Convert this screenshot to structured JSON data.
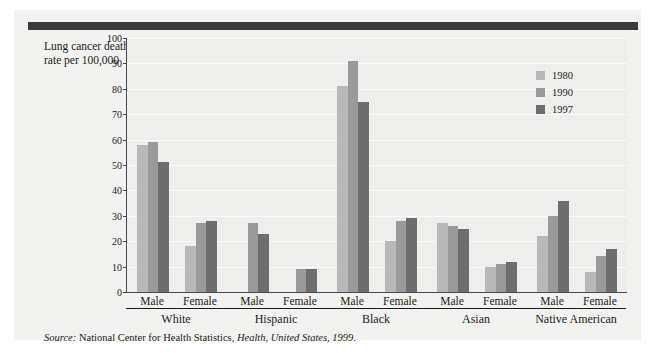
{
  "axis_title": "Lung cancer death rate per 100,000",
  "source": {
    "label": "Source:",
    "agency": " National Center for Health Statistics, ",
    "publication": "Health, United States, 1999",
    "end": "."
  },
  "legend": {
    "items": [
      {
        "label": "1980",
        "color": "#b8b8b8"
      },
      {
        "label": "1990",
        "color": "#9a9a9a"
      },
      {
        "label": "1997",
        "color": "#6e6e6e"
      }
    ]
  },
  "chart_data": {
    "type": "bar",
    "title": "",
    "xlabel": "",
    "ylabel": "Lung cancer death rate per 100,000",
    "ylim": [
      0,
      100
    ],
    "ytick_step": 10,
    "yticks": [
      0,
      10,
      20,
      30,
      40,
      50,
      60,
      70,
      80,
      90,
      100
    ],
    "grid": true,
    "legend_position": "top-right",
    "series": [
      {
        "name": "1980",
        "color": "#b8b8b8"
      },
      {
        "name": "1990",
        "color": "#9a9a9a"
      },
      {
        "name": "1997",
        "color": "#6e6e6e"
      }
    ],
    "groups": [
      {
        "name": "White",
        "subgroups": [
          {
            "name": "Male",
            "values": [
              58,
              59,
              51
            ]
          },
          {
            "name": "Female",
            "values": [
              18,
              27,
              28
            ]
          }
        ]
      },
      {
        "name": "Hispanic",
        "subgroups": [
          {
            "name": "Male",
            "values": [
              null,
              27,
              23
            ]
          },
          {
            "name": "Female",
            "values": [
              null,
              9,
              9
            ]
          }
        ]
      },
      {
        "name": "Black",
        "subgroups": [
          {
            "name": "Male",
            "values": [
              81,
              91,
              75
            ]
          },
          {
            "name": "Female",
            "values": [
              20,
              28,
              29
            ]
          }
        ]
      },
      {
        "name": "Asian",
        "subgroups": [
          {
            "name": "Male",
            "values": [
              27,
              26,
              25
            ]
          },
          {
            "name": "Female",
            "values": [
              10,
              11,
              12
            ]
          }
        ]
      },
      {
        "name": "Native American",
        "subgroups": [
          {
            "name": "Male",
            "values": [
              22,
              30,
              36
            ]
          },
          {
            "name": "Female",
            "values": [
              8,
              14,
              17
            ]
          }
        ]
      }
    ]
  }
}
